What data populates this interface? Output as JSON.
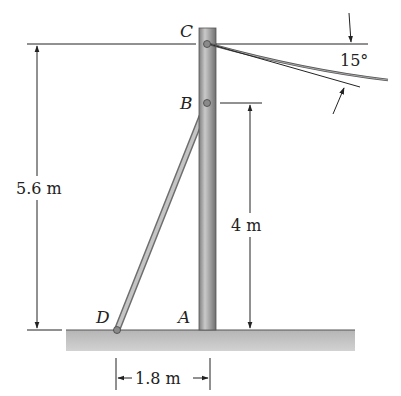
{
  "figure": {
    "points": {
      "C": "C",
      "B": "B",
      "A": "A",
      "D": "D"
    },
    "dimensions": {
      "total_height": "5.6 m",
      "b_height": "4 m",
      "base_distance": "1.8 m",
      "cable_angle": "15°"
    },
    "colors": {
      "pole": "#9a9a9a",
      "pole_highlight": "#c8c8c8",
      "strut": "#b0b0b0",
      "ground": "#c4c4c4",
      "line": "#222222"
    }
  }
}
